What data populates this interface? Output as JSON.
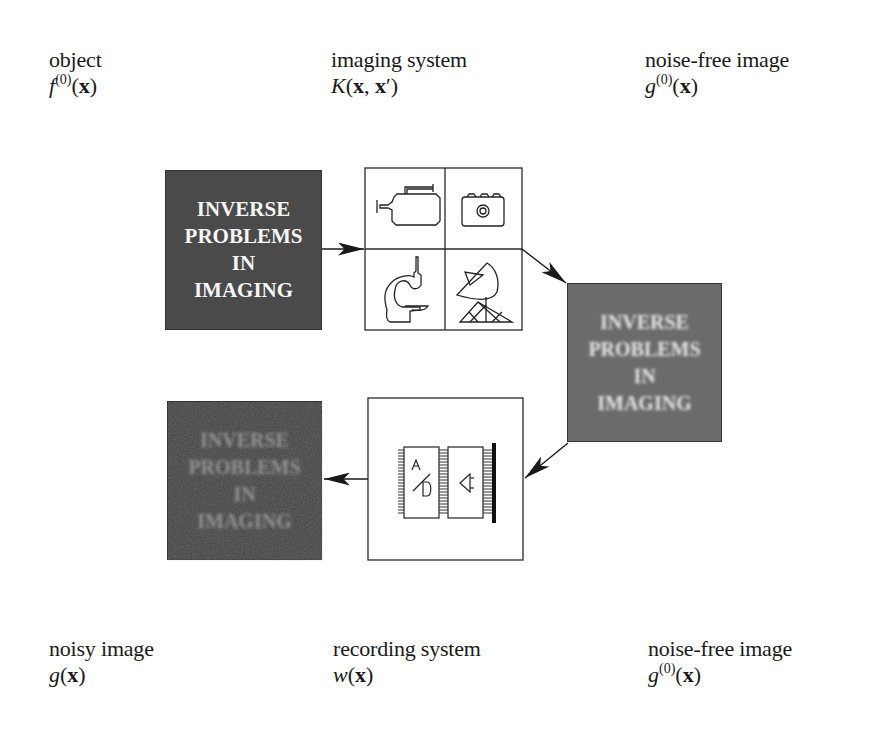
{
  "top_labels": [
    {
      "name": "object",
      "symbol": "f",
      "superscript": "(0)",
      "argument": "x",
      "math": "f^(0)(x)"
    },
    {
      "name": "imaging system",
      "symbol": "K",
      "argument": "x, x′",
      "math": "K(x, x′)"
    },
    {
      "name": "noise-free image",
      "symbol": "g",
      "superscript": "(0)",
      "argument": "x",
      "math": "g^(0)(x)"
    }
  ],
  "bottom_labels": [
    {
      "name": "noisy image",
      "symbol": "g",
      "argument": "x",
      "math": "g(x)"
    },
    {
      "name": "recording system",
      "symbol": "w",
      "argument": "x",
      "math": "w(x)"
    },
    {
      "name": "noise-free image",
      "symbol": "g",
      "superscript": "(0)",
      "argument": "x",
      "math": "g^(0)(x)"
    }
  ],
  "image_text": [
    "INVERSE",
    "PROBLEMS",
    "IN",
    "IMAGING"
  ],
  "boxes": {
    "object": {
      "state": "sharp",
      "fill": "#4a4a4a",
      "text_color": "#f6f6f6"
    },
    "imaging_system": {
      "icons": [
        "video-camera-icon",
        "photo-camera-icon",
        "microscope-icon",
        "satellite-dish-icon"
      ]
    },
    "noise_free": {
      "state": "blurred",
      "fill": "#6b6b6b",
      "text_color": "#e8e8e8"
    },
    "recording_system": {
      "icons": [
        "ad-converter-chip-icon",
        "amplifier-chip-icon"
      ],
      "chip_label_1": "A/D"
    },
    "noisy": {
      "state": "blurred-noisy",
      "fill": "#3e3e3e",
      "text_color": "#8a8a8a"
    }
  },
  "flow": [
    "object",
    "imaging_system",
    "noise_free",
    "recording_system",
    "noisy"
  ],
  "colors": {
    "line": "#2a2a2a",
    "background": "#ffffff"
  }
}
